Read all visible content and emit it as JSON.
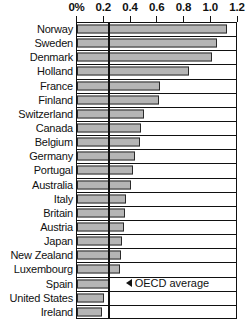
{
  "chart_data": {
    "type": "bar",
    "orientation": "horizontal",
    "title": "",
    "xlabel": "",
    "ylabel": "",
    "xlim": [
      0,
      1.2
    ],
    "grid": false,
    "legend": null,
    "tick_labels": [
      "0%",
      "0.2",
      "0.4",
      "0.6",
      "0.8",
      "1.0",
      "1.2"
    ],
    "tick_values": [
      0,
      0.2,
      0.4,
      0.6,
      0.8,
      1.0,
      1.2
    ],
    "categories": [
      "Norway",
      "Sweden",
      "Denmark",
      "Holland",
      "France",
      "Finland",
      "Switzerland",
      "Canada",
      "Belgium",
      "Germany",
      "Portugal",
      "Australia",
      "Italy",
      "Britain",
      "Austria",
      "Japan",
      "New Zealand",
      "Luxembourg",
      "Spain",
      "United States",
      "Ireland"
    ],
    "values": [
      1.12,
      1.05,
      1.01,
      0.84,
      0.62,
      0.61,
      0.5,
      0.48,
      0.47,
      0.43,
      0.42,
      0.4,
      0.37,
      0.36,
      0.35,
      0.34,
      0.33,
      0.32,
      0.24,
      0.2,
      0.19
    ],
    "annotations": [
      {
        "label": "OECD average",
        "type": "vertical-reference-line",
        "value": 0.33,
        "arrow": "left-triangle"
      }
    ],
    "colors": {
      "bar_fill": "#b5b5b5",
      "bar_stroke": "#2a2a2a",
      "axis": "#111111",
      "background": "#ffffff"
    }
  }
}
